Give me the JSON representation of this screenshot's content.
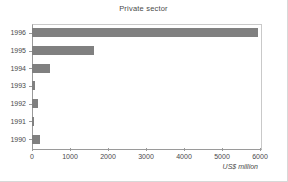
{
  "chart_data": {
    "type": "bar",
    "orientation": "horizontal",
    "title": "Private sector",
    "xlabel": "US$ million",
    "ylabel": "",
    "categories": [
      "1996",
      "1995",
      "1994",
      "1993",
      "1992",
      "1991",
      "1990"
    ],
    "values": [
      5950,
      1620,
      480,
      90,
      150,
      60,
      200
    ],
    "xlim": [
      0,
      6000
    ],
    "xticks": [
      0,
      1000,
      2000,
      3000,
      4000,
      5000,
      6000
    ],
    "xtick_labels": [
      "0",
      "1000",
      "2000",
      "3000",
      "4000",
      "5000",
      "6000"
    ],
    "grid": false,
    "legend": null,
    "bar_color": "#808080",
    "axis_color": "#9a9a9a",
    "text_color": "#4a4a4a",
    "background": "#ffffff"
  }
}
